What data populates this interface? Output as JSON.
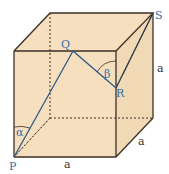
{
  "diagram": {
    "type": "cube",
    "colors": {
      "fill": "#f5dfbf",
      "edge": "#3a3128",
      "path": "#2e6fa8",
      "point_label": "#2e6fa8",
      "dimension_label": "#333333"
    },
    "points": {
      "P": "P",
      "Q": "Q",
      "R": "R",
      "S": "S"
    },
    "angles": {
      "alpha": "α",
      "beta": "β"
    },
    "dimensions": {
      "bottom": "a",
      "depth": "a",
      "height": "a"
    }
  }
}
